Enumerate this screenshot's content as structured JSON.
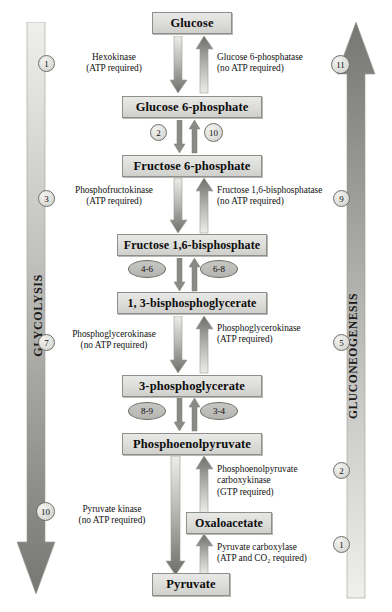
{
  "pathways": {
    "left": {
      "label": "GLYCOLYSIS",
      "direction": "down",
      "steps": [
        {
          "n": "1",
          "y": 59
        },
        {
          "n": "3",
          "y": 194
        },
        {
          "n": "7",
          "y": 338
        },
        {
          "n": "10",
          "y": 506
        }
      ]
    },
    "right": {
      "label": "GLUCONEOGENESIS",
      "direction": "up",
      "steps": [
        {
          "n": "11",
          "y": 59
        },
        {
          "n": "9",
          "y": 194
        },
        {
          "n": "5",
          "y": 338
        },
        {
          "n": "2",
          "y": 466
        },
        {
          "n": "1",
          "y": 540
        }
      ]
    }
  },
  "metabolites": [
    {
      "name": "Glucose",
      "x": 152,
      "y": 12,
      "w": 80,
      "h": 22,
      "fs": 12.5
    },
    {
      "name": "Glucose 6-phosphate",
      "x": 122,
      "y": 96,
      "w": 140,
      "h": 22,
      "fs": 12.5
    },
    {
      "name": "Fructose 6-phosphate",
      "x": 122,
      "y": 155,
      "w": 140,
      "h": 22,
      "fs": 12.5
    },
    {
      "name": "Fructose 1,6-bisphosphate",
      "x": 117,
      "y": 234,
      "w": 150,
      "h": 22,
      "fs": 12.0
    },
    {
      "name": "1, 3-bisphosphoglycerate",
      "x": 117,
      "y": 292,
      "w": 150,
      "h": 22,
      "fs": 12.0
    },
    {
      "name": "3-phosphoglycerate",
      "x": 122,
      "y": 375,
      "w": 140,
      "h": 22,
      "fs": 12.5
    },
    {
      "name": "Phosphoenolpyruvate",
      "x": 122,
      "y": 433,
      "w": 140,
      "h": 22,
      "fs": 12.5
    },
    {
      "name": "Oxaloacetate",
      "x": 186,
      "y": 512,
      "w": 86,
      "h": 22,
      "fs": 12.0
    },
    {
      "name": "Pyruvate",
      "x": 152,
      "y": 573,
      "w": 78,
      "h": 23,
      "fs": 12.5
    }
  ],
  "enzymes": [
    {
      "id": "hexokinase",
      "lines": [
        "Hexokinase",
        "(ATP required)"
      ],
      "align": "center",
      "x": 66,
      "y": 53,
      "w": 100
    },
    {
      "id": "glucose-6-phosphatase",
      "lines": [
        "Glucose 6-phosphatase",
        "(no ATP required)"
      ],
      "align": "left",
      "x": 216,
      "y": 53,
      "w": 130
    },
    {
      "id": "phosphofructokinase",
      "lines": [
        "Phosphofructokinase",
        "(ATP required)"
      ],
      "align": "center",
      "x": 62,
      "y": 186,
      "w": 108
    },
    {
      "id": "fructose-1-6-bisphosphatase",
      "lines": [
        "Fructose 1,6-bisphosphatase",
        "(no ATP required)"
      ],
      "align": "left",
      "x": 218,
      "y": 186,
      "w": 140
    },
    {
      "id": "phosphoglycerokinase-forward",
      "lines": [
        "Phosphoglycerokinase",
        "(no ATP required)"
      ],
      "align": "center",
      "x": 60,
      "y": 330,
      "w": 110
    },
    {
      "id": "phosphoglycerokinase-reverse",
      "lines": [
        "Phosphoglycerokinase",
        "(ATP required)"
      ],
      "align": "left",
      "x": 218,
      "y": 324,
      "w": 120
    },
    {
      "id": "pyruvate-kinase",
      "lines": [
        "Pyruvate kinase",
        "(no ATP required)"
      ],
      "align": "center",
      "x": 60,
      "y": 505,
      "w": 110
    },
    {
      "id": "pep-carboxykinase",
      "lines": [
        "Phosphoenolpyruvate",
        "carboxykinase",
        "(GTP required)"
      ],
      "align": "left",
      "x": 218,
      "y": 465,
      "w": 128
    },
    {
      "id": "pyruvate-carboxylase",
      "lines": [
        "Pyruvate carboxylase",
        "(ATP and CO₂ required)"
      ],
      "align": "left",
      "x": 218,
      "y": 543,
      "w": 130
    }
  ],
  "step_markers": [
    {
      "label": "2",
      "shape": "circle",
      "x": 150,
      "y": 124
    },
    {
      "label": "10",
      "shape": "circle",
      "x": 204,
      "y": 124
    },
    {
      "label": "4-6",
      "shape": "oval",
      "x": 128,
      "y": 260
    },
    {
      "label": "6-8",
      "shape": "oval",
      "x": 198,
      "y": 260
    },
    {
      "label": "8-9",
      "shape": "oval",
      "x": 128,
      "y": 402
    },
    {
      "label": "3-4",
      "shape": "oval",
      "x": 198,
      "y": 402
    }
  ],
  "colors": {
    "box_fill": "#dcdcd9",
    "box_border": "#8e8e8a",
    "arrow_dark": "#6e6e6b",
    "arrow_light": "#e3e3e1",
    "text": "#111111"
  }
}
